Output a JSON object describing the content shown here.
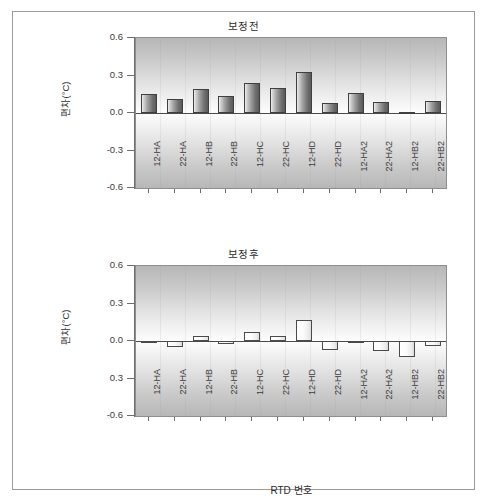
{
  "figure": {
    "background": "#ffffff",
    "border_color": "#9a9a9a"
  },
  "chart_data": [
    {
      "type": "bar",
      "panel_id": "before",
      "title": "보정전",
      "xlabel": "",
      "ylabel": "편차(°C)",
      "ylim": [
        -0.6,
        0.6
      ],
      "yticks": [
        0.6,
        0.3,
        0.0,
        -0.3,
        -0.6
      ],
      "ytick_labels": [
        "0.6",
        "0.3",
        "0.0",
        "-0.3",
        "-0.6"
      ],
      "grid": false,
      "legend": "none",
      "bar_style": "dark-gradient",
      "categories": [
        "12-HA",
        "22-HA",
        "12-HB",
        "22-HB",
        "12-HC",
        "22-HC",
        "12-HD",
        "22-HD",
        "12-HA2",
        "22-HA2",
        "12-HB2",
        "22-HB2"
      ],
      "values": [
        0.15,
        0.11,
        0.19,
        0.14,
        0.24,
        0.2,
        0.33,
        0.08,
        0.16,
        0.09,
        0.01,
        0.1
      ]
    },
    {
      "type": "bar",
      "panel_id": "after",
      "title": "보정후",
      "xlabel": "RTD 번호",
      "ylabel": "편차(°C)",
      "ylim": [
        -0.6,
        0.6
      ],
      "yticks": [
        0.6,
        0.3,
        0.0,
        -0.3,
        -0.6
      ],
      "ytick_labels": [
        "0.6",
        "0.3",
        "0.0",
        "0.3",
        "-0.6"
      ],
      "grid": false,
      "legend": "none",
      "bar_style": "light-gradient",
      "categories": [
        "12-HA",
        "22-HA",
        "12-HB",
        "22-HB",
        "12-HC",
        "22-HC",
        "12-HD",
        "22-HD",
        "12-HA2",
        "22-HA2",
        "12-HB2",
        "22-HB2"
      ],
      "values": [
        -0.01,
        -0.05,
        0.04,
        -0.02,
        0.07,
        0.04,
        0.17,
        -0.07,
        -0.01,
        -0.08,
        -0.13,
        -0.04
      ]
    }
  ]
}
